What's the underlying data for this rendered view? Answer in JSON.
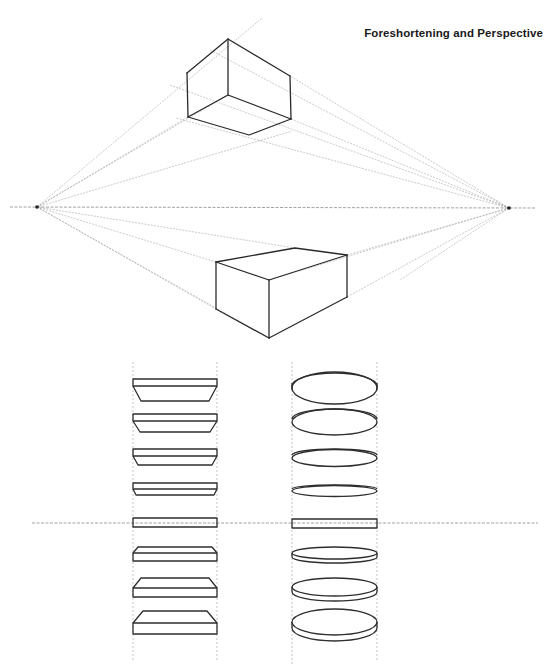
{
  "header": {
    "title": "Foreshortening and Perspective"
  },
  "diagram": {
    "colors": {
      "ink": "#2a2a2a",
      "construction": "#9a9a9a",
      "background": "#ffffff"
    },
    "horizon_upper_y": 207,
    "horizon_lower_y": 523,
    "vanishing_points": [
      {
        "name": "left",
        "x": 37,
        "y": 207
      },
      {
        "name": "right",
        "x": 509,
        "y": 208
      }
    ],
    "boxes": [
      {
        "name": "box-above-horizon",
        "view": "seen from below"
      },
      {
        "name": "box-below-horizon",
        "view": "seen from above"
      }
    ],
    "disc_columns": [
      {
        "name": "rectangular-slabs",
        "count": 8
      },
      {
        "name": "elliptical-discs",
        "count": 8
      }
    ]
  }
}
